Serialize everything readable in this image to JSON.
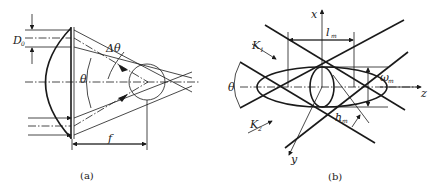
{
  "figure": {
    "panel_a": {
      "caption": "(a)",
      "labels": {
        "aperture": "D",
        "aperture_sub": "0",
        "delta_theta": "Δθ",
        "theta": "θ",
        "focal_length": "f"
      }
    },
    "panel_b": {
      "caption": "(b)",
      "labels": {
        "axis_x": "x",
        "axis_y": "y",
        "axis_z": "z",
        "length": "l",
        "length_sub": "m",
        "width": "ω",
        "width_sub": "m",
        "height": "h",
        "height_sub": "m",
        "theta": "θ",
        "k1": "K",
        "k1_sub": "1",
        "k2": "K",
        "k2_sub": "2"
      }
    }
  }
}
